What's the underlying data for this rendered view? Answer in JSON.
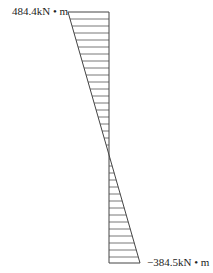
{
  "diagram": {
    "type": "bending-moment-diagram",
    "top_value_label": "484.4kN • m",
    "bottom_value_label": "−384.5kN • m",
    "top_value": 484.4,
    "bottom_value": -384.5,
    "unit": "kN • m",
    "colors": {
      "line": "#444444",
      "hatch": "#555555",
      "background": "#ffffff"
    }
  }
}
